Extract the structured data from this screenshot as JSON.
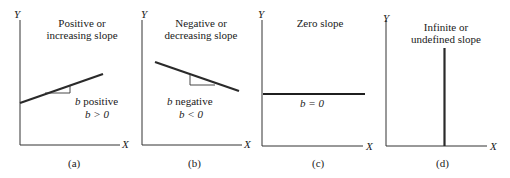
{
  "panels": [
    {
      "id": "a",
      "title_line1": "Positive or",
      "title_line2": "increasing slope",
      "annotation_line1_var": "b",
      "annotation_line1_text": " positive",
      "annotation_line2": "b > 0",
      "caption": "(a)",
      "y_axis_label": "Y",
      "x_axis_label": "X"
    },
    {
      "id": "b",
      "title_line1": "Negative or",
      "title_line2": "decreasing slope",
      "annotation_line1_var": "b",
      "annotation_line1_text": " negative",
      "annotation_line2": "b < 0",
      "caption": "(b)",
      "y_axis_label": "Y",
      "x_axis_label": "X"
    },
    {
      "id": "c",
      "title_line1": "Zero slope",
      "annotation_line1": "b = 0",
      "caption": "(c)",
      "y_axis_label": "Y",
      "x_axis_label": "X"
    },
    {
      "id": "d",
      "title_line1": "Infinite or",
      "title_line2": "undefined slope",
      "caption": "(d)",
      "y_axis_label": "Y",
      "x_axis_label": "X"
    }
  ],
  "colors": {
    "line": "#2a2a2a",
    "axis": "#333333",
    "background": "#ffffff"
  }
}
